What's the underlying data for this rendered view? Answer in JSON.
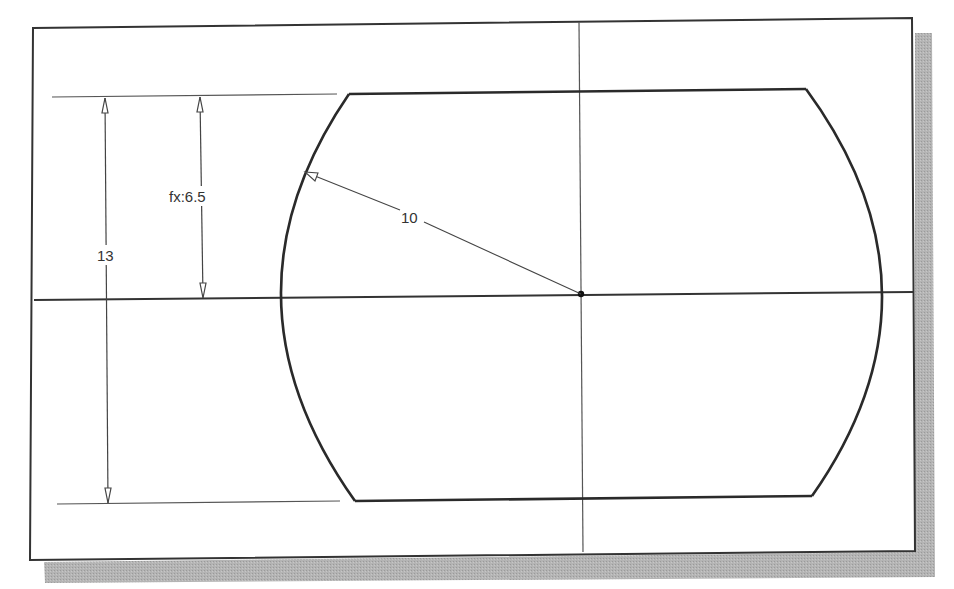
{
  "drawing": {
    "type": "2D sketch",
    "description": "Barrel-shaped sketch profile with two horizontal lines and two arcs, dimensioned",
    "colors": {
      "background": "#ffffff",
      "frame": "#333333",
      "shadow": "#a9a9a9",
      "geometry": "#2a2a2a",
      "dimension": "#444444"
    },
    "dimensions": {
      "total_height_label": "13",
      "half_height_label": "fx:6.5",
      "arc_radius_label": "10"
    },
    "entities": [
      {
        "type": "line",
        "role": "top-edge"
      },
      {
        "type": "line",
        "role": "bottom-edge"
      },
      {
        "type": "arc",
        "role": "left-arc"
      },
      {
        "type": "arc",
        "role": "right-arc"
      },
      {
        "type": "centerline",
        "role": "horizontal-axis"
      },
      {
        "type": "centerline",
        "role": "vertical-axis"
      },
      {
        "type": "point",
        "role": "center-point"
      }
    ]
  }
}
